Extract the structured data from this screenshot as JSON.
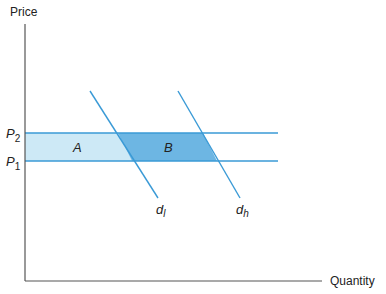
{
  "figure": {
    "y_axis_label": "Price",
    "x_axis_label": "Quantity",
    "price_levels": [
      {
        "symbol": "P",
        "subscript": "2",
        "name": "high price"
      },
      {
        "symbol": "P",
        "subscript": "1",
        "name": "low price"
      }
    ],
    "regions": [
      {
        "label": "A",
        "color": "#cde9f6"
      },
      {
        "label": "B",
        "color": "#6db6e3"
      }
    ],
    "demand_curves": [
      {
        "symbol": "d",
        "subscript": "l"
      },
      {
        "symbol": "d",
        "subscript": "h"
      }
    ],
    "colors": {
      "line": "#3a9ad6",
      "axis": "#333333",
      "region_a": "#cde9f6",
      "region_b": "#6db6e3"
    }
  }
}
